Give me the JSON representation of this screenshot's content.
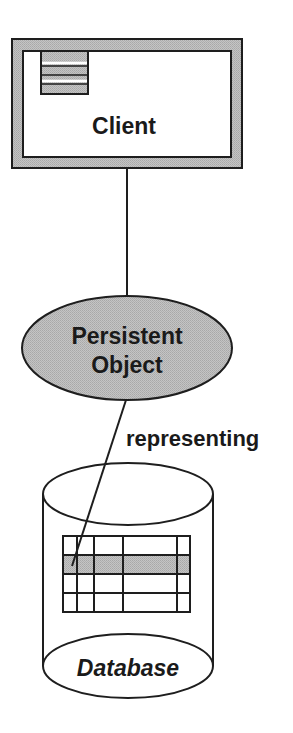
{
  "diagram": {
    "colors": {
      "stroke": "#1e1e1e",
      "fill_gray": "#b9b9b9",
      "fill_white": "#ffffff"
    },
    "client": {
      "label": "Client",
      "icon": "menu-stripes-icon"
    },
    "persistent_object": {
      "label_line1": "Persistent",
      "label_line2": "Object"
    },
    "relation": {
      "label": "representing"
    },
    "database": {
      "label": "Database",
      "table": {
        "rows": 4,
        "columns": 5,
        "highlighted_row": 2
      }
    }
  }
}
